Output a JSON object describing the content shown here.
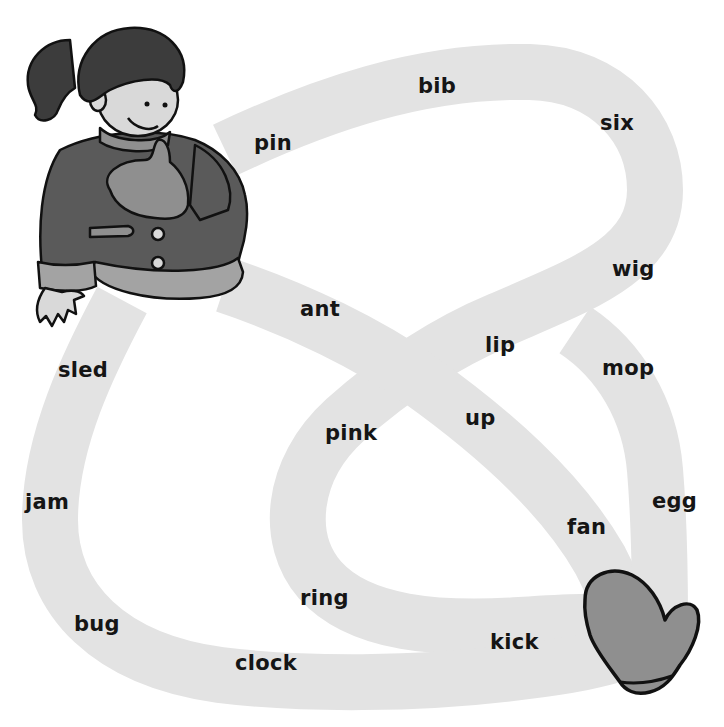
{
  "colors": {
    "background": "#ffffff",
    "path": "#e3e3e3",
    "coat": "#5a5a5a",
    "hair": "#3c3c3c",
    "skin": "#d9d9d9",
    "mitten": "#8f8f8f",
    "cuff": "#a3a3a3",
    "outline": "#111111",
    "text": "#151515"
  },
  "characters": {
    "start": "girl in winter coat",
    "goal": "mitten"
  },
  "words": [
    {
      "text": "bib",
      "x": 418,
      "y": 76
    },
    {
      "text": "six",
      "x": 600,
      "y": 113
    },
    {
      "text": "pin",
      "x": 254,
      "y": 133
    },
    {
      "text": "wig",
      "x": 612,
      "y": 259
    },
    {
      "text": "ant",
      "x": 300,
      "y": 299
    },
    {
      "text": "lip",
      "x": 485,
      "y": 335
    },
    {
      "text": "sled",
      "x": 58,
      "y": 360
    },
    {
      "text": "mop",
      "x": 602,
      "y": 358
    },
    {
      "text": "pink",
      "x": 325,
      "y": 423
    },
    {
      "text": "up",
      "x": 465,
      "y": 408
    },
    {
      "text": "jam",
      "x": 25,
      "y": 492
    },
    {
      "text": "egg",
      "x": 652,
      "y": 491
    },
    {
      "text": "fan",
      "x": 567,
      "y": 517
    },
    {
      "text": "ring",
      "x": 300,
      "y": 588
    },
    {
      "text": "bug",
      "x": 74,
      "y": 614
    },
    {
      "text": "kick",
      "x": 490,
      "y": 632
    },
    {
      "text": "clock",
      "x": 235,
      "y": 653
    }
  ]
}
